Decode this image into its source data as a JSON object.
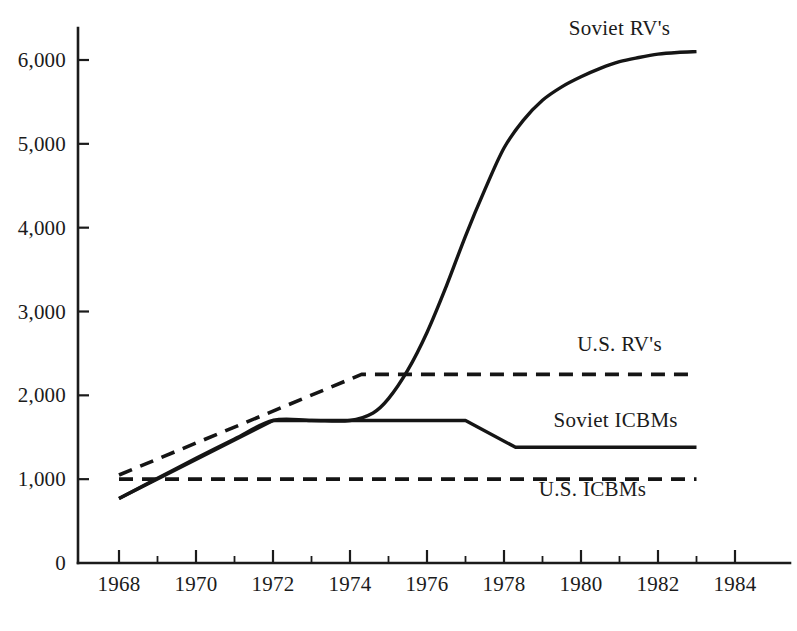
{
  "chart_data": {
    "type": "line",
    "title": "",
    "subtitle": "",
    "xlabel": "",
    "ylabel": "",
    "xlim": [
      1967.2,
      1984.6
    ],
    "ylim": [
      0,
      6500
    ],
    "grid": false,
    "legend_position": "inline-annotations",
    "x_ticks_major": [
      1968,
      1970,
      1972,
      1974,
      1976,
      1978,
      1980,
      1982,
      1984
    ],
    "x_ticks_minor": [
      1969,
      1971,
      1973,
      1975,
      1977,
      1979,
      1981,
      1983
    ],
    "x_tick_labels": [
      "1968",
      "1970",
      "1972",
      "1974",
      "1976",
      "1978",
      "1980",
      "1982",
      "1984"
    ],
    "y_ticks": [
      0,
      1000,
      2000,
      3000,
      4000,
      5000,
      6000
    ],
    "y_tick_labels": [
      "0",
      "1,000",
      "2,000",
      "3,000",
      "4,000",
      "5,000",
      "6,000"
    ],
    "series": [
      {
        "name": "Soviet RV's",
        "label": "Soviet RV's",
        "style": "solid",
        "color": "#151515",
        "label_x": 1981.0,
        "label_y": 6300,
        "x": [
          1968.0,
          1969.0,
          1970.0,
          1971.0,
          1972.0,
          1973.0,
          1974.0,
          1974.6,
          1975.0,
          1975.5,
          1976.0,
          1976.5,
          1977.0,
          1977.5,
          1978.0,
          1978.5,
          1979.0,
          1979.5,
          1980.0,
          1980.5,
          1981.0,
          1981.5,
          1982.0,
          1982.5,
          1983.0
        ],
        "y": [
          770,
          1010,
          1250,
          1480,
          1700,
          1700,
          1700,
          1790,
          1960,
          2300,
          2750,
          3300,
          3900,
          4450,
          4950,
          5280,
          5520,
          5680,
          5800,
          5900,
          5980,
          6030,
          6070,
          6090,
          6100
        ]
      },
      {
        "name": "Soviet ICBMs",
        "label": "Soviet ICBMs",
        "style": "solid",
        "color": "#151515",
        "label_x": 1980.9,
        "label_y": 1620,
        "x": [
          1968.0,
          1972.0,
          1977.0,
          1978.3,
          1983.0
        ],
        "y": [
          770,
          1700,
          1700,
          1380,
          1380
        ]
      },
      {
        "name": "U.S. RV's",
        "label": "U.S. RV's",
        "style": "dashed",
        "color": "#151515",
        "label_x": 1981.0,
        "label_y": 2530,
        "x": [
          1968.0,
          1974.3,
          1983.0
        ],
        "y": [
          1050,
          2250,
          2250
        ]
      },
      {
        "name": "U.S. ICBMs",
        "label": "U.S. ICBMs",
        "style": "dashed",
        "color": "#151515",
        "label_x": 1980.3,
        "label_y": 800,
        "x": [
          1968.0,
          1983.0
        ],
        "y": [
          1000,
          1000
        ]
      }
    ]
  },
  "axes": {
    "x_axis_name": "year-axis",
    "y_axis_name": "count-axis"
  }
}
